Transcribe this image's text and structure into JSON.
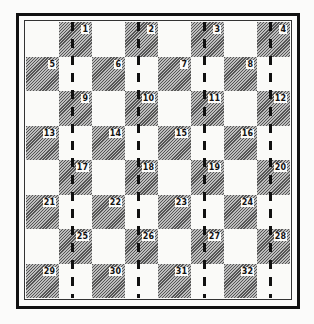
{
  "board": {
    "rows": 8,
    "cols": 8,
    "dark_color": "#9a9a9a",
    "light_color": "#fafaf8",
    "squares": [
      {
        "row": 0,
        "col": 1,
        "label": "1"
      },
      {
        "row": 0,
        "col": 3,
        "label": "2"
      },
      {
        "row": 0,
        "col": 5,
        "label": "3"
      },
      {
        "row": 0,
        "col": 7,
        "label": "4"
      },
      {
        "row": 1,
        "col": 0,
        "label": "5"
      },
      {
        "row": 1,
        "col": 2,
        "label": "6"
      },
      {
        "row": 1,
        "col": 4,
        "label": "7"
      },
      {
        "row": 1,
        "col": 6,
        "label": "8"
      },
      {
        "row": 2,
        "col": 1,
        "label": "9"
      },
      {
        "row": 2,
        "col": 3,
        "label": "10"
      },
      {
        "row": 2,
        "col": 5,
        "label": "11"
      },
      {
        "row": 2,
        "col": 7,
        "label": "12"
      },
      {
        "row": 3,
        "col": 0,
        "label": "13"
      },
      {
        "row": 3,
        "col": 2,
        "label": "14"
      },
      {
        "row": 3,
        "col": 4,
        "label": "15"
      },
      {
        "row": 3,
        "col": 6,
        "label": "16"
      },
      {
        "row": 4,
        "col": 1,
        "label": "17"
      },
      {
        "row": 4,
        "col": 3,
        "label": "18"
      },
      {
        "row": 4,
        "col": 5,
        "label": "19"
      },
      {
        "row": 4,
        "col": 7,
        "label": "20"
      },
      {
        "row": 5,
        "col": 0,
        "label": "21"
      },
      {
        "row": 5,
        "col": 2,
        "label": "22"
      },
      {
        "row": 5,
        "col": 4,
        "label": "23"
      },
      {
        "row": 5,
        "col": 6,
        "label": "24"
      },
      {
        "row": 6,
        "col": 1,
        "label": "25"
      },
      {
        "row": 6,
        "col": 3,
        "label": "26"
      },
      {
        "row": 6,
        "col": 5,
        "label": "27"
      },
      {
        "row": 6,
        "col": 7,
        "label": "28"
      },
      {
        "row": 7,
        "col": 0,
        "label": "29"
      },
      {
        "row": 7,
        "col": 2,
        "label": "30"
      },
      {
        "row": 7,
        "col": 4,
        "label": "31"
      },
      {
        "row": 7,
        "col": 6,
        "label": "32"
      }
    ],
    "dashed_lines_at_columns": [
      1,
      3,
      5,
      7
    ]
  }
}
